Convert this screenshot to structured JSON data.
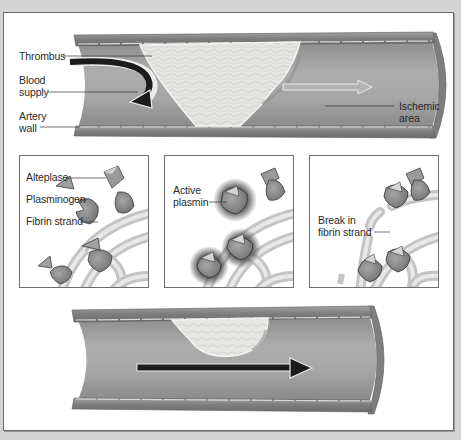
{
  "figure": {
    "top_artery": {
      "labels": {
        "thrombus": "Thrombus",
        "blood_supply_line1": "Blood",
        "blood_supply_line2": "supply",
        "artery_wall_line1": "Artery",
        "artery_wall_line2": "wall",
        "ischemic_line1": "Ischemic",
        "ischemic_line2": "area"
      }
    },
    "panels": [
      {
        "id": "panel-1",
        "labels": [
          "Alteplase",
          "Plasminogen",
          "Fibrin strand"
        ]
      },
      {
        "id": "panel-2",
        "labels": [
          "Active",
          "plasmin"
        ]
      },
      {
        "id": "panel-3",
        "labels": [
          "Break in",
          "fibrin strand"
        ]
      }
    ],
    "bottom_artery": {
      "flow_arrow": "restored-flow-arrow"
    },
    "colors": {
      "background": "#d4d4d4",
      "artery_wall": "#8a8a8a",
      "artery_lumen": "#a3a3a3",
      "clot": "#e6e6e2",
      "arrow": "#1e1e1e",
      "fibrin": "#cfcfcf",
      "molecule": "#8c8c8c"
    }
  }
}
